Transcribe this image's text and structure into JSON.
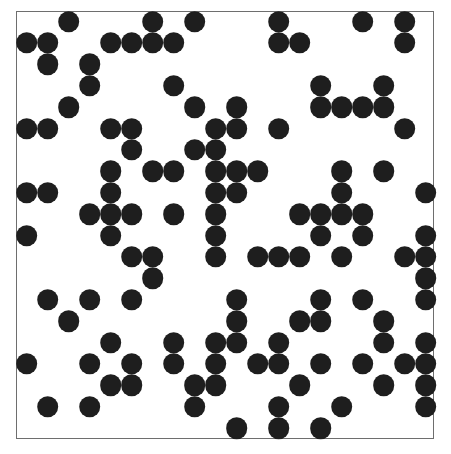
{
  "board": {
    "columns": 20,
    "rows": 20,
    "cell_color": "#1e1e1e",
    "border_color": "#6e6e6e",
    "background_color": "#ffffff",
    "live_cells_by_row": [
      [
        2,
        6,
        8,
        12,
        16,
        18
      ],
      [
        0,
        1,
        4,
        5,
        6,
        7,
        12,
        13,
        18
      ],
      [
        1,
        3
      ],
      [
        3,
        7,
        14,
        17
      ],
      [
        2,
        8,
        10,
        14,
        15,
        16,
        17
      ],
      [
        0,
        1,
        4,
        5,
        9,
        10,
        12,
        18
      ],
      [
        5,
        8,
        9
      ],
      [
        4,
        6,
        7,
        9,
        10,
        11,
        15,
        17
      ],
      [
        0,
        1,
        4,
        9,
        10,
        15,
        19
      ],
      [
        3,
        4,
        5,
        7,
        9,
        13,
        14,
        15,
        16
      ],
      [
        0,
        4,
        9,
        14,
        16,
        19
      ],
      [
        5,
        6,
        9,
        11,
        12,
        13,
        15,
        18,
        19
      ],
      [
        6,
        19
      ],
      [
        1,
        3,
        5,
        10,
        14,
        16,
        19
      ],
      [
        2,
        10,
        13,
        14,
        17
      ],
      [
        4,
        7,
        9,
        10,
        12,
        17,
        19
      ],
      [
        0,
        3,
        5,
        7,
        9,
        11,
        12,
        14,
        16,
        18,
        19
      ],
      [
        4,
        5,
        8,
        9,
        13,
        17,
        19
      ],
      [
        1,
        3,
        8,
        12,
        15,
        19
      ],
      [
        10,
        12,
        14
      ]
    ]
  }
}
